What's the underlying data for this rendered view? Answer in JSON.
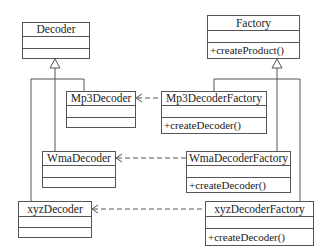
{
  "diagram": {
    "type": "uml-class-diagram",
    "classes": [
      {
        "id": "decoder",
        "name": "Decoder",
        "attributes": [],
        "operations": []
      },
      {
        "id": "factory",
        "name": "Factory",
        "attributes": [],
        "operations": [
          "+createProduct()"
        ]
      },
      {
        "id": "mp3decoder",
        "name": "Mp3Decoder",
        "attributes": [],
        "operations": []
      },
      {
        "id": "mp3decoderfactory",
        "name": "Mp3DecoderFactory",
        "attributes": [],
        "operations": [
          "+createDecoder()"
        ]
      },
      {
        "id": "wmadecoder",
        "name": "WmaDecoder",
        "attributes": [],
        "operations": []
      },
      {
        "id": "wmadecoderfactory",
        "name": "WmaDecoderFactory",
        "attributes": [],
        "operations": [
          "+createDecoder()"
        ]
      },
      {
        "id": "xyzdecoder",
        "name": "xyzDecoder",
        "attributes": [],
        "operations": []
      },
      {
        "id": "xyzdecoderfactory",
        "name": "xyzDecoderFactory",
        "attributes": [],
        "operations": [
          "+createDecoder()"
        ]
      }
    ],
    "relations": [
      {
        "type": "generalization",
        "from": "Mp3Decoder",
        "to": "Decoder"
      },
      {
        "type": "generalization",
        "from": "WmaDecoder",
        "to": "Decoder"
      },
      {
        "type": "generalization",
        "from": "xyzDecoder",
        "to": "Decoder"
      },
      {
        "type": "generalization",
        "from": "Mp3DecoderFactory",
        "to": "Factory"
      },
      {
        "type": "generalization",
        "from": "WmaDecoderFactory",
        "to": "Factory"
      },
      {
        "type": "generalization",
        "from": "xyzDecoderFactory",
        "to": "Factory"
      },
      {
        "type": "dependency",
        "from": "Mp3DecoderFactory",
        "to": "Mp3Decoder"
      },
      {
        "type": "dependency",
        "from": "WmaDecoderFactory",
        "to": "WmaDecoder"
      },
      {
        "type": "dependency",
        "from": "xyzDecoderFactory",
        "to": "xyzDecoder"
      }
    ]
  },
  "labels": {
    "decoder": "Decoder",
    "factory": "Factory",
    "factory_op": "+createProduct()",
    "mp3decoder": "Mp3Decoder",
    "mp3decoderfactory": "Mp3DecoderFactory",
    "mp3decoderfactory_op": "+createDecoder()",
    "wmadecoder": "WmaDecoder",
    "wmadecoderfactory": "WmaDecoderFactory",
    "wmadecoderfactory_op": "+createDecoder()",
    "xyzdecoder": "xyzDecoder",
    "xyzdecoderfactory": "xyzDecoderFactory",
    "xyzdecoderfactory_op": "+createDecoder()"
  },
  "colors": {
    "line": "#555555",
    "text": "#222222",
    "background": "#ffffff"
  }
}
